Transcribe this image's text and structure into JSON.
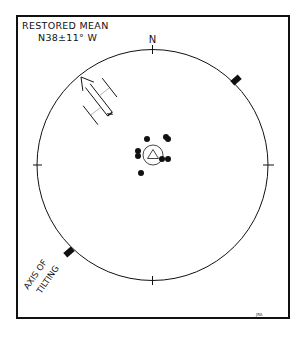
{
  "diagram": {
    "title_line1": "RESTORED MEAN",
    "title_line2": "N38±11° W",
    "north_label": "N",
    "axis_label_line1": "AXIS OF",
    "axis_label_line2": "TILTING",
    "credit": "JRA",
    "colors": {
      "ink": "#111111",
      "background": "#ffffff"
    },
    "elements": {
      "net_circle": "equal-area stereonet primitive circle",
      "cardinal_ticks": [
        "N",
        "E",
        "S",
        "W"
      ],
      "mean_direction_symbol": "open triangle within circle of confidence",
      "data_points": "10 solid dots clustered near center",
      "arrow": "restored mean direction arrow pointing NW (N38°W)",
      "axis_markers": "two solid squares on primitive marking axis of tilting (NE–SW)"
    }
  }
}
